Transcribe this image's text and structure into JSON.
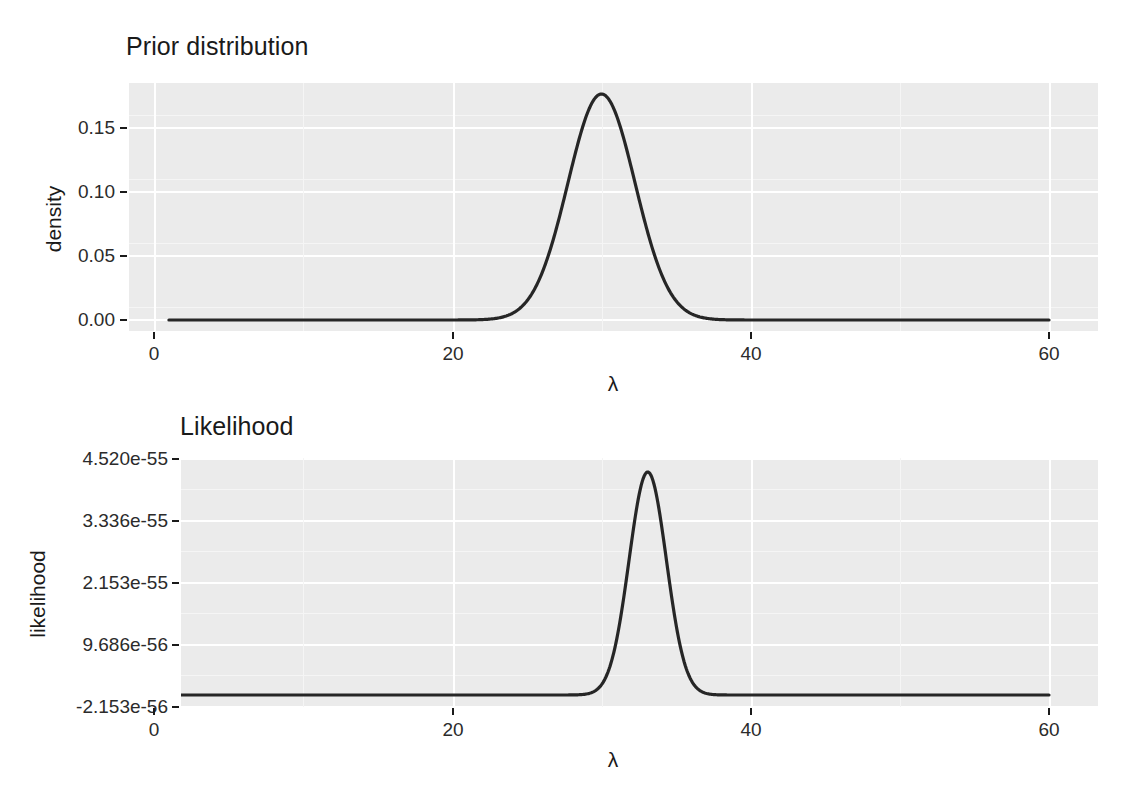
{
  "figure": {
    "background": "#ffffff",
    "panel_background": "#ebebeb",
    "grid_color": "#ffffff",
    "curve_color": "#262626"
  },
  "chart_data": [
    {
      "type": "line",
      "title": "Prior distribution",
      "xlabel": "λ",
      "ylabel": "density",
      "xlim": [
        1,
        60
      ],
      "ylim": [
        0.0,
        0.1875
      ],
      "xticks": [
        0,
        20,
        40,
        60
      ],
      "xtick_labels": [
        "0",
        "20",
        "40",
        "60"
      ],
      "yticks": [
        0.0,
        0.05,
        0.1,
        0.15
      ],
      "ytick_labels": [
        "0.00",
        "0.05",
        "0.10",
        "0.15"
      ],
      "grid": true,
      "legend": "none",
      "distribution": "normal",
      "mean": 30,
      "sd": 2.25,
      "peak_x": 30,
      "peak_y": 0.1775,
      "x": [
        1,
        5,
        10,
        15,
        18,
        20,
        22,
        23,
        24,
        25,
        26,
        27,
        28,
        29,
        30,
        31,
        32,
        33,
        34,
        35,
        36,
        37,
        38,
        40,
        45,
        50,
        55,
        60
      ],
      "y": [
        0.0,
        0.0,
        0.0,
        0.0,
        0.0,
        0.0,
        0.0006,
        0.0018,
        0.0046,
        0.0104,
        0.0209,
        0.0376,
        0.0604,
        0.0869,
        0.1775,
        0.0869,
        0.0604,
        0.0376,
        0.0209,
        0.0104,
        0.0046,
        0.0018,
        0.0006,
        0.0,
        0.0,
        0.0,
        0.0,
        0.0
      ]
    },
    {
      "type": "line",
      "title": "Likelihood",
      "xlabel": "λ",
      "ylabel": "likelihood",
      "xlim": [
        1,
        60
      ],
      "ylim": [
        -2.153e-56,
        4.83e-55
      ],
      "xticks": [
        0,
        20,
        40,
        60
      ],
      "xtick_labels": [
        "0",
        "20",
        "40",
        "60"
      ],
      "yticks": [
        -2.153e-56,
        9.686e-56,
        2.153e-55,
        3.336e-55,
        4.52e-55
      ],
      "ytick_labels": [
        "-2.153e-56",
        "9.686e-56",
        "2.153e-55",
        "3.336e-55",
        "4.520e-55"
      ],
      "grid": true,
      "legend": "none",
      "distribution": "normal",
      "mean": 33.1,
      "sd": 1.25,
      "peak_x": 33.1,
      "peak_y": 4.32e-55,
      "x": [
        1,
        10,
        20,
        25,
        28,
        29,
        30,
        31,
        32,
        33,
        34,
        35,
        36,
        37,
        38,
        40,
        50,
        60
      ],
      "y": [
        0.0,
        0.0,
        0.0,
        0.0,
        0.0,
        1e-57,
        1.3e-56,
        7.4e-56,
        2.47e-55,
        4.32e-55,
        2.47e-55,
        7.4e-56,
        1.3e-56,
        1e-57,
        0.0,
        0.0,
        0.0,
        0.0
      ]
    }
  ]
}
